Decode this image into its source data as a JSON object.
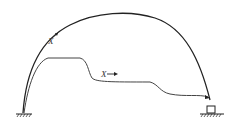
{
  "diagram": {
    "type": "arch-structure",
    "colors": {
      "stroke": "#222222",
      "background": "#ffffff"
    },
    "labels": {
      "arch_force": "X",
      "inner_force": "X"
    },
    "elements": [
      {
        "id": "outer-arch",
        "desc": "semicircular arch from left support to right support"
      },
      {
        "id": "inner-curve",
        "desc": "stepped path from left base to right support"
      },
      {
        "id": "left-support",
        "desc": "fixed ground support (hatched)"
      },
      {
        "id": "right-support",
        "desc": "box support on hatched ground"
      }
    ]
  }
}
